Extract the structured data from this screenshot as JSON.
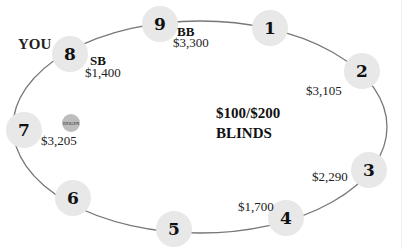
{
  "table": {
    "blinds_line1": "$100/$200",
    "blinds_line2": "BLINDS",
    "you_label": "YOU",
    "dealer_label": "DEALER"
  },
  "seats": [
    {
      "number": "1",
      "x": 270,
      "y": 28,
      "stack": "",
      "role": ""
    },
    {
      "number": "2",
      "x": 362,
      "y": 71,
      "stack": "$3,105",
      "role": ""
    },
    {
      "number": "3",
      "x": 369,
      "y": 170,
      "stack": "$2,290",
      "role": ""
    },
    {
      "number": "4",
      "x": 286,
      "y": 218,
      "stack": "$1,700",
      "role": ""
    },
    {
      "number": "5",
      "x": 174,
      "y": 229,
      "stack": "",
      "role": ""
    },
    {
      "number": "6",
      "x": 73,
      "y": 198,
      "stack": "",
      "role": ""
    },
    {
      "number": "7",
      "x": 24,
      "y": 130,
      "stack": "$3,205",
      "role": ""
    },
    {
      "number": "8",
      "x": 70,
      "y": 54,
      "stack": "$1,400",
      "role": "SB"
    },
    {
      "number": "9",
      "x": 160,
      "y": 24,
      "stack": "$3,300",
      "role": "BB"
    }
  ],
  "colors": {
    "seat_fill": "#e8e8e8",
    "dealer_fill": "#bdbdbd",
    "table_line": "#777777"
  }
}
